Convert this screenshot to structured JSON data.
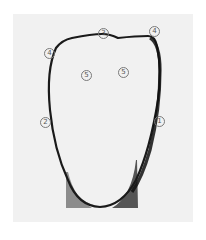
{
  "figure": {
    "background_color": "#f1f1f1",
    "outline_color": "#1a1a1a",
    "labels": [
      {
        "id": "label-3-top",
        "text": "3",
        "x": 103,
        "y": 33
      },
      {
        "id": "label-4-left",
        "text": "4",
        "x": 49,
        "y": 53
      },
      {
        "id": "label-4-right",
        "text": "4",
        "x": 154,
        "y": 31
      },
      {
        "id": "label-5-left",
        "text": "5",
        "x": 86,
        "y": 75
      },
      {
        "id": "label-5-right",
        "text": "5",
        "x": 123,
        "y": 72
      },
      {
        "id": "label-2-left",
        "text": "2",
        "x": 45,
        "y": 122
      },
      {
        "id": "label-1-right",
        "text": "1",
        "x": 159,
        "y": 121
      }
    ]
  }
}
